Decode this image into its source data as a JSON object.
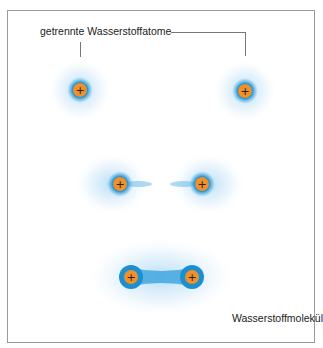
{
  "title_label": "getrennte Wasserstoffatome",
  "molecule_label": "Wasserstoffmolekül",
  "nucleus_symbol": "+",
  "colors": {
    "nucleus": "#f0902a",
    "electron_core": "#1e9ad8",
    "electron_cloud": "#8ecbef",
    "frame": "#9a9a9a"
  },
  "stages": [
    {
      "name": "separated",
      "atoms": [
        {
          "x": 80,
          "y": 90
        },
        {
          "x": 245,
          "y": 91
        }
      ]
    },
    {
      "name": "approaching",
      "atoms": [
        {
          "x": 120,
          "y": 184
        },
        {
          "x": 202,
          "y": 184
        }
      ]
    },
    {
      "name": "molecule",
      "atoms": [
        {
          "x": 131,
          "y": 277
        },
        {
          "x": 192,
          "y": 277
        }
      ]
    }
  ]
}
